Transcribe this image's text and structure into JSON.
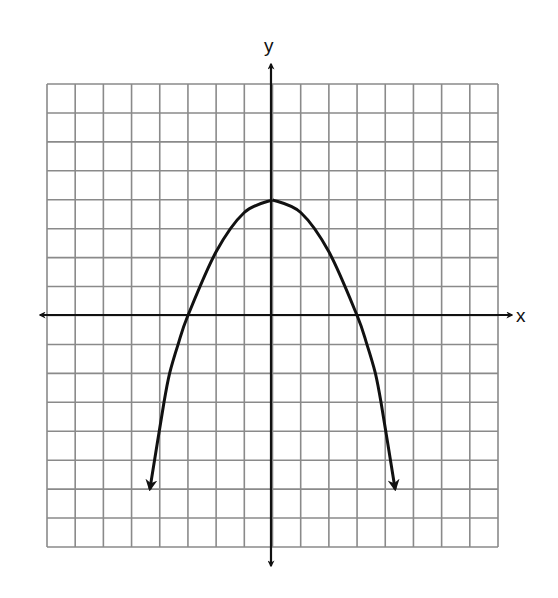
{
  "chart_data": {
    "type": "line",
    "title": "",
    "xlabel": "x",
    "ylabel": "y",
    "grid": true,
    "xlim": [
      -8,
      8
    ],
    "ylim": [
      -8,
      8
    ],
    "tick_labels": false,
    "series": [
      {
        "name": "parabola",
        "shape": "downward-opening parabola with arrowheads at both ends",
        "equation_estimate": "y = 4 - (4/9)x^2",
        "vertex": [
          0,
          4
        ],
        "x_intercepts": [
          -3,
          3
        ],
        "y_intercept": 4,
        "points": [
          {
            "x": -4.35,
            "y": -6
          },
          {
            "x": -3.85,
            "y": -3
          },
          {
            "x": -3.65,
            "y": -2
          },
          {
            "x": -3.35,
            "y": -1
          },
          {
            "x": -3,
            "y": 0
          },
          {
            "x": -2,
            "y": 2.2
          },
          {
            "x": -1,
            "y": 3.56
          },
          {
            "x": 0,
            "y": 4
          },
          {
            "x": 1,
            "y": 3.56
          },
          {
            "x": 2,
            "y": 2.2
          },
          {
            "x": 3,
            "y": 0
          },
          {
            "x": 3.35,
            "y": -1
          },
          {
            "x": 3.65,
            "y": -2
          },
          {
            "x": 3.85,
            "y": -3
          },
          {
            "x": 4.35,
            "y": -6
          }
        ]
      }
    ]
  },
  "labels": {
    "x_axis": "x",
    "y_axis": "y"
  },
  "colors": {
    "grid": "#8a8a8a",
    "axes": "#111111",
    "curve": "#111111",
    "background": "#ffffff"
  }
}
